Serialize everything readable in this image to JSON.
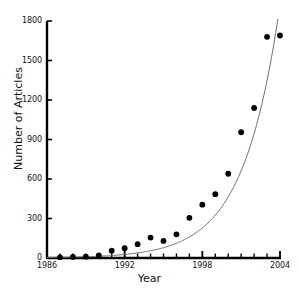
{
  "chart_data": {
    "type": "scatter",
    "title": "",
    "subtitle": "",
    "xlabel": "Year",
    "ylabel": "Number of Articles",
    "xlim": [
      1986,
      2004
    ],
    "ylim": [
      0,
      1800
    ],
    "grid": false,
    "legend": null,
    "x_major_ticks": [
      1986,
      1992,
      1998,
      2004
    ],
    "x_major_tick_labels": [
      "1986",
      "1992",
      "1998",
      "2004"
    ],
    "x_minor_tick_interval": 1,
    "y_ticks": [
      0,
      300,
      600,
      900,
      1200,
      1500,
      1800
    ],
    "y_tick_labels": [
      "0",
      "300",
      "600",
      "900",
      "1200",
      "1500",
      "1800"
    ],
    "marker": "filled-circle",
    "marker_color": "#000000",
    "fit_line": {
      "style": "solid",
      "color": "#6e6e6e",
      "description": "exponential trend curve through points"
    },
    "x": [
      1987,
      1988,
      1989,
      1990,
      1991,
      1992,
      1993,
      1994,
      1995,
      1996,
      1997,
      1998,
      1999,
      2000,
      2001,
      2002,
      2003,
      2004
    ],
    "values": [
      5,
      8,
      10,
      20,
      55,
      75,
      105,
      155,
      130,
      180,
      305,
      405,
      485,
      640,
      955,
      1140,
      1680,
      1690
    ],
    "series": [
      {
        "name": "Number of Articles",
        "values": [
          5,
          8,
          10,
          20,
          55,
          75,
          105,
          155,
          130,
          180,
          305,
          405,
          485,
          640,
          955,
          1140,
          1680,
          1690
        ]
      }
    ],
    "points": [
      {
        "year": 1987,
        "articles": 5
      },
      {
        "year": 1988,
        "articles": 8
      },
      {
        "year": 1989,
        "articles": 10
      },
      {
        "year": 1990,
        "articles": 20
      },
      {
        "year": 1991,
        "articles": 55
      },
      {
        "year": 1992,
        "articles": 75
      },
      {
        "year": 1993,
        "articles": 105
      },
      {
        "year": 1994,
        "articles": 155
      },
      {
        "year": 1995,
        "articles": 130
      },
      {
        "year": 1996,
        "articles": 180
      },
      {
        "year": 1997,
        "articles": 305
      },
      {
        "year": 1998,
        "articles": 405
      },
      {
        "year": 1999,
        "articles": 485
      },
      {
        "year": 2000,
        "articles": 640
      },
      {
        "year": 2001,
        "articles": 955
      },
      {
        "year": 2002,
        "articles": 1140
      },
      {
        "year": 2003,
        "articles": 1680
      },
      {
        "year": 2004,
        "articles": 1690
      }
    ],
    "colors": {
      "marker": "#000000",
      "axis": "#000000",
      "curve": "#6e6e6e",
      "text": "#111111",
      "background": "#ffffff"
    }
  }
}
